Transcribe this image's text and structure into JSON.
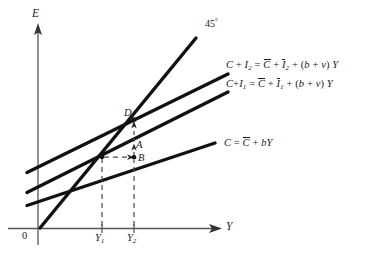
{
  "figure": {
    "type": "keynesian-cross-diagram",
    "axes": {
      "y_axis_label": "E",
      "x_axis_label": "Y",
      "origin_label": "0"
    },
    "ticks": {
      "x": [
        {
          "id": "y1",
          "label_main": "Y",
          "label_sub": "1"
        },
        {
          "id": "y2",
          "label_main": "Y",
          "label_sub": "2"
        }
      ]
    },
    "reference_line": {
      "name": "forty-five-degree-line",
      "label": "45",
      "degree_symbol": "°"
    },
    "curves": [
      {
        "id": "c-plus-i2",
        "label_parts": {
          "lhs_c": "C",
          "lhs_plus": " + ",
          "lhs_i": "I",
          "lhs_i_sub": "2",
          "equals": " = ",
          "cbar": "C",
          "plus1": " + ",
          "ibar": "I",
          "ibar_sub": "2",
          "plus2": " + (",
          "b": "b",
          "plusv": " + ",
          "v": "v",
          "close": ") ",
          "y": "Y"
        }
      },
      {
        "id": "c-plus-i1",
        "label_parts": {
          "lhs_c": "C",
          "lhs_plus": "+",
          "lhs_i": "I",
          "lhs_i_sub": "1",
          "equals": "  = ",
          "cbar": "C",
          "plus1": " + ",
          "ibar": "I",
          "ibar_sub": "1",
          "plus2": " + (",
          "b": "b",
          "plusv": " + ",
          "v": "v",
          "close": ") ",
          "y": "Y"
        }
      },
      {
        "id": "consumption",
        "label_parts": {
          "lhs_c": "C",
          "equals": " = ",
          "cbar": "C",
          "plus1": " + ",
          "b": "b",
          "y": "Y"
        }
      }
    ],
    "points": [
      {
        "id": "point-d",
        "label": "D"
      },
      {
        "id": "point-a",
        "label": "A"
      },
      {
        "id": "point-b",
        "label": "B"
      }
    ],
    "colors": {
      "ink": "#1a1a1a",
      "curve": "#111111",
      "axis": "#555555",
      "dashed": "#4a4a4a",
      "background": "#ffffff"
    }
  }
}
